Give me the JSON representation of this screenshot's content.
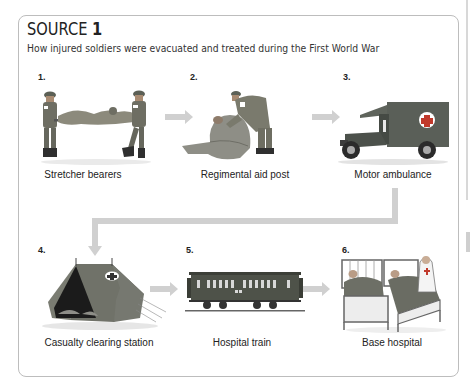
{
  "source": {
    "heading_word": "SOURCE",
    "heading_number": "1",
    "subtitle": "How injured soldiers were evacuated and treated during the First World War"
  },
  "steps": [
    {
      "number": "1.",
      "label": "Stretcher bearers",
      "icon": "stretcher-bearers-illustration"
    },
    {
      "number": "2.",
      "label": "Regimental aid post",
      "icon": "regimental-aid-post-illustration"
    },
    {
      "number": "3.",
      "label": "Motor ambulance",
      "icon": "motor-ambulance-illustration"
    },
    {
      "number": "4.",
      "label": "Casualty clearing station",
      "icon": "tent-illustration"
    },
    {
      "number": "5.",
      "label": "Hospital train",
      "icon": "hospital-train-illustration"
    },
    {
      "number": "6.",
      "label": "Base hospital",
      "icon": "base-hospital-illustration"
    }
  ],
  "colors": {
    "arrow": "#cfcfcf",
    "box_border": "#bdbdbd",
    "uniform": "#6e6e63",
    "vehicle": "#5a5f58",
    "cross": "#c0392b"
  }
}
